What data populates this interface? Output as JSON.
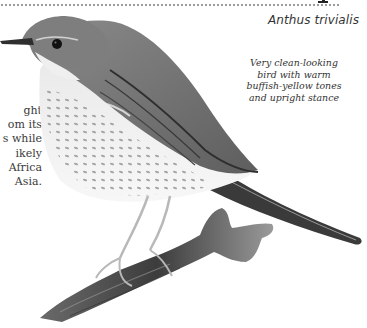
{
  "header": {
    "scientific_name": "Anthus trivialis"
  },
  "body_text": {
    "lines": [
      "ght",
      "om its",
      "s while",
      "ikely",
      "Africa",
      "Asia."
    ]
  },
  "annotation": {
    "lines": [
      "Very clean-looking",
      "bird with warm",
      "buffish-yellow tones",
      "and upright stance"
    ]
  },
  "illustration": {
    "subject": "Tree pipit perched on branch",
    "palette": {
      "background": "#ffffff",
      "dark": "#2a2a2a",
      "mid": "#7a7a7a",
      "light": "#d8d8d8"
    }
  }
}
